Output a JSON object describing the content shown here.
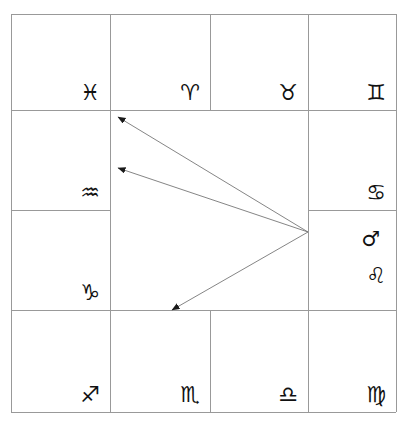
{
  "chart": {
    "type": "south-indian-rasi-chart",
    "canvas": {
      "width": 407,
      "height": 430
    },
    "background_color": "#ffffff",
    "line_color": "#999999",
    "glyph_color": "#111111",
    "arrow_color": "#777777",
    "grid": {
      "outer": {
        "left": 11,
        "top": 14,
        "right": 396,
        "bottom": 412
      },
      "vertical_lines_x": [
        11,
        110,
        210,
        308,
        396
      ],
      "horizontal_lines_y": [
        14,
        110,
        210,
        310,
        412
      ],
      "center_is_hollow": true,
      "note": "Line at y=210 is drawn only across the left and right columns; line at x=210 is drawn only across the top and bottom rows."
    },
    "houses": [
      {
        "id": "house-pisces",
        "sign_name": "Pisces",
        "sign_glyph": "♓",
        "planets": [],
        "x": 11,
        "y": 14,
        "w": 99,
        "h": 96
      },
      {
        "id": "house-aries",
        "sign_name": "Aries",
        "sign_glyph": "♈",
        "planets": [],
        "x": 110,
        "y": 14,
        "w": 100,
        "h": 96
      },
      {
        "id": "house-taurus",
        "sign_name": "Taurus",
        "sign_glyph": "♉",
        "planets": [],
        "x": 210,
        "y": 14,
        "w": 98,
        "h": 96
      },
      {
        "id": "house-gemini",
        "sign_name": "Gemini",
        "sign_glyph": "♊",
        "planets": [],
        "x": 308,
        "y": 14,
        "w": 88,
        "h": 96
      },
      {
        "id": "house-cancer",
        "sign_name": "Cancer",
        "sign_glyph": "♋",
        "planets": [],
        "x": 308,
        "y": 110,
        "w": 88,
        "h": 100
      },
      {
        "id": "house-leo",
        "sign_name": "Leo",
        "sign_glyph": "♌",
        "planets": [
          "Mars"
        ],
        "x": 308,
        "y": 210,
        "w": 88,
        "h": 100
      },
      {
        "id": "house-virgo",
        "sign_name": "Virgo",
        "sign_glyph": "♍",
        "planets": [],
        "x": 308,
        "y": 310,
        "w": 88,
        "h": 102
      },
      {
        "id": "house-libra",
        "sign_name": "Libra",
        "sign_glyph": "♎",
        "planets": [],
        "x": 210,
        "y": 310,
        "w": 98,
        "h": 102
      },
      {
        "id": "house-scorpio",
        "sign_name": "Scorpio",
        "sign_glyph": "♏",
        "planets": [],
        "x": 110,
        "y": 310,
        "w": 100,
        "h": 102
      },
      {
        "id": "house-sagittarius",
        "sign_name": "Sagittarius",
        "sign_glyph": "♐",
        "planets": [],
        "x": 11,
        "y": 310,
        "w": 99,
        "h": 102
      },
      {
        "id": "house-capricorn",
        "sign_name": "Capricorn",
        "sign_glyph": "♑",
        "planets": [],
        "x": 11,
        "y": 210,
        "w": 99,
        "h": 100
      },
      {
        "id": "house-aquarius",
        "sign_name": "Aquarius",
        "sign_glyph": "♒",
        "planets": [],
        "x": 11,
        "y": 110,
        "w": 99,
        "h": 100
      }
    ],
    "planet_glyphs": {
      "Mars": "♂"
    },
    "aspects": {
      "source_label": "Mars",
      "origin": {
        "x": 308,
        "y": 232
      },
      "arrows": [
        {
          "id": "aspect-arrow-1",
          "from_house": "house-leo",
          "to_house": "house-aquarius",
          "to_point": {
            "x": 118,
            "y": 117
          },
          "target_label": "Pisces / Aquarius boundary"
        },
        {
          "id": "aspect-arrow-2",
          "from_house": "house-leo",
          "to_house": "house-aquarius",
          "to_point": {
            "x": 118,
            "y": 168
          },
          "target_label": "Aquarius"
        },
        {
          "id": "aspect-arrow-3",
          "from_house": "house-leo",
          "to_house": "house-scorpio",
          "to_point": {
            "x": 172,
            "y": 310
          },
          "target_label": "Scorpio / Capricorn boundary"
        }
      ]
    }
  }
}
